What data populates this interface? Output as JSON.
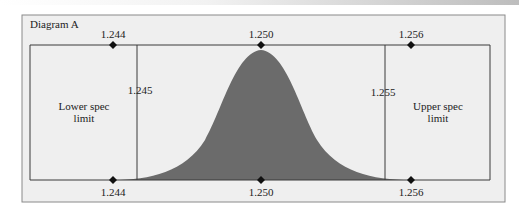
{
  "diagram": {
    "title": "Diagram A",
    "top_axis": {
      "labels": [
        "1.244",
        "1.250",
        "1.256"
      ]
    },
    "bottom_axis": {
      "labels": [
        "1.244",
        "1.250",
        "1.256"
      ]
    },
    "lower_spec": {
      "value": "1.245",
      "label_line1": "Lower spec",
      "label_line2": "limit"
    },
    "upper_spec": {
      "value": "1.255",
      "label_line1": "Upper spec",
      "label_line2": "limit"
    },
    "colors": {
      "frame_fill": "#efefef",
      "frame_border": "#8a8a8a",
      "curve_fill": "#6b6b6b",
      "line": "#3a3a3a",
      "marker": "#111111"
    }
  }
}
